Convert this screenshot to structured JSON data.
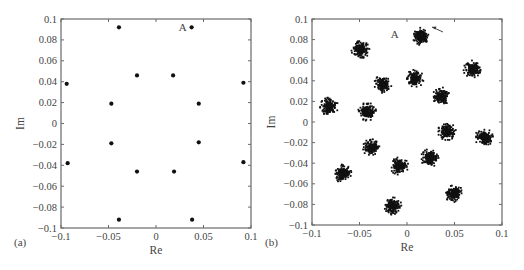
{
  "figure": {
    "panels": [
      {
        "id": "a",
        "label": "(a)",
        "xlabel": "Re",
        "ylabel": "Im",
        "annotation": "A"
      },
      {
        "id": "b",
        "label": "(b)",
        "xlabel": "Re",
        "ylabel": "Im",
        "annotation": "A"
      }
    ],
    "x_ticks": [
      "−0.1",
      "−0.05",
      "0",
      "0.05",
      "0.1"
    ],
    "y_ticks": [
      "0.1",
      "0.08",
      "0.06",
      "0.04",
      "0.02",
      "0",
      "−0.02",
      "−0.04",
      "−0.06",
      "−0.08",
      "−0.1"
    ],
    "colors": {
      "frame": "#6a6a6a",
      "marker": "#111111",
      "text": "#444444"
    }
  },
  "chart_data": [
    {
      "type": "scatter",
      "panel": "(a)",
      "title": "",
      "xlabel": "Re",
      "ylabel": "Im",
      "xlim": [
        -0.1,
        0.1
      ],
      "ylim": [
        -0.1,
        0.1
      ],
      "x_tick_labels": [
        "-0.1",
        "-0.05",
        "0",
        "0.05",
        "0.1"
      ],
      "y_tick_labels": [
        "-0.1",
        "-0.08",
        "-0.06",
        "-0.04",
        "-0.02",
        "0",
        "0.02",
        "0.04",
        "0.06",
        "0.08",
        "0.1"
      ],
      "grid": false,
      "legend": null,
      "annotations": [
        {
          "text": "A",
          "x": 0.0375,
          "y": 0.092,
          "note": "label placed left of point A"
        }
      ],
      "series": [
        {
          "name": "constellation points",
          "marker": "dot",
          "points": [
            {
              "x": -0.039,
              "y": 0.092
            },
            {
              "x": 0.0375,
              "y": 0.092,
              "label": "A"
            },
            {
              "x": -0.02,
              "y": 0.046
            },
            {
              "x": 0.018,
              "y": 0.046
            },
            {
              "x": -0.094,
              "y": 0.038
            },
            {
              "x": 0.092,
              "y": 0.039
            },
            {
              "x": -0.047,
              "y": 0.019
            },
            {
              "x": 0.045,
              "y": 0.019
            },
            {
              "x": -0.047,
              "y": -0.019
            },
            {
              "x": 0.045,
              "y": -0.018
            },
            {
              "x": -0.093,
              "y": -0.038
            },
            {
              "x": 0.092,
              "y": -0.037
            },
            {
              "x": -0.02,
              "y": -0.046
            },
            {
              "x": 0.019,
              "y": -0.046
            },
            {
              "x": -0.039,
              "y": -0.092
            },
            {
              "x": 0.038,
              "y": -0.092
            }
          ]
        }
      ]
    },
    {
      "type": "scatter",
      "panel": "(b)",
      "title": "",
      "xlabel": "Re",
      "ylabel": "Im",
      "xlim": [
        -0.1,
        0.1
      ],
      "ylim": [
        -0.1,
        0.1
      ],
      "x_tick_labels": [
        "-0.1",
        "-0.05",
        "0",
        "0.05",
        "0.1"
      ],
      "y_tick_labels": [
        "-0.1",
        "-0.08",
        "-0.06",
        "-0.04",
        "-0.02",
        "0",
        "0.02",
        "0.04",
        "0.06",
        "0.08",
        "0.1"
      ],
      "grid": false,
      "legend": null,
      "annotations": [
        {
          "text": "A",
          "x": -0.013,
          "y": 0.085,
          "arrow_to": {
            "x": 0.019,
            "y": 0.09
          },
          "note": "arrow points to cluster A from upper right"
        }
      ],
      "series": [
        {
          "name": "noisy received clusters (centers)",
          "marker": "dense point cloud",
          "cluster_radius": 0.007,
          "points": [
            {
              "x": 0.015,
              "y": 0.083,
              "label": "A"
            },
            {
              "x": -0.049,
              "y": 0.07
            },
            {
              "x": -0.025,
              "y": 0.037
            },
            {
              "x": 0.008,
              "y": 0.042
            },
            {
              "x": 0.069,
              "y": 0.051
            },
            {
              "x": 0.036,
              "y": 0.025
            },
            {
              "x": -0.082,
              "y": 0.015
            },
            {
              "x": -0.042,
              "y": 0.01
            },
            {
              "x": 0.042,
              "y": -0.009
            },
            {
              "x": 0.081,
              "y": -0.015
            },
            {
              "x": -0.037,
              "y": -0.025
            },
            {
              "x": -0.008,
              "y": -0.043
            },
            {
              "x": 0.024,
              "y": -0.035
            },
            {
              "x": -0.068,
              "y": -0.05
            },
            {
              "x": 0.049,
              "y": -0.069
            },
            {
              "x": -0.015,
              "y": -0.082
            }
          ]
        }
      ]
    }
  ]
}
